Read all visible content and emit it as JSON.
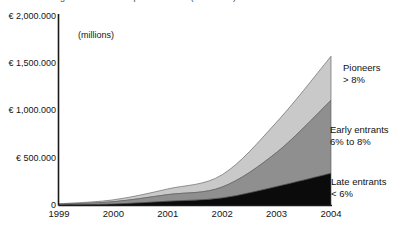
{
  "title_clipped": "growth of the European markets (in millions)",
  "units_note": "(millions)",
  "axis": {
    "y_ticks": [
      "€ 2,000.000",
      "€ 1,500.000",
      "€ 1,000.000",
      "€ 500.000",
      "0"
    ],
    "x_ticks": [
      "1999",
      "2000",
      "2001",
      "2002",
      "2003",
      "2004"
    ]
  },
  "annotations": {
    "pioneers": {
      "line1": "Pioneers",
      "line2": "> 8%"
    },
    "early_entrants": {
      "line1": "Early entrants",
      "line2": "6% to 8%"
    },
    "late_entrants": {
      "line1": "Late entrants",
      "line2": "< 6%"
    }
  },
  "colors": {
    "pioneers": "#c9c9c9",
    "early_entrants": "#8f8f8f",
    "late_entrants": "#0b0b0b",
    "axis": "#1a1a1a",
    "outline": "#555555",
    "background": "#ffffff"
  },
  "chart_data": {
    "type": "area",
    "title": "",
    "xlabel": "",
    "ylabel": "",
    "units": "millions of euro",
    "stacked": true,
    "grid": false,
    "legend_position": "right-inline-annotations",
    "ylim": [
      0,
      2000000
    ],
    "ytick_values": [
      2000000,
      1500000,
      1000000,
      500000,
      0
    ],
    "x": [
      "1999",
      "2000",
      "2001",
      "2002",
      "2003",
      "2004"
    ],
    "series": [
      {
        "name": "Late entrants < 6%",
        "color": "#0b0b0b",
        "values": [
          5000,
          15000,
          45000,
          80000,
          200000,
          340000
        ]
      },
      {
        "name": "Early entrants 6% to 8%",
        "color": "#8f8f8f",
        "values": [
          8000,
          25000,
          70000,
          115000,
          360000,
          770000
        ]
      },
      {
        "name": "Pioneers > 8%",
        "color": "#c9c9c9",
        "values": [
          5000,
          20000,
          60000,
          130000,
          320000,
          465000
        ]
      }
    ],
    "totals": [
      18000,
      60000,
      175000,
      325000,
      880000,
      1575000
    ]
  }
}
